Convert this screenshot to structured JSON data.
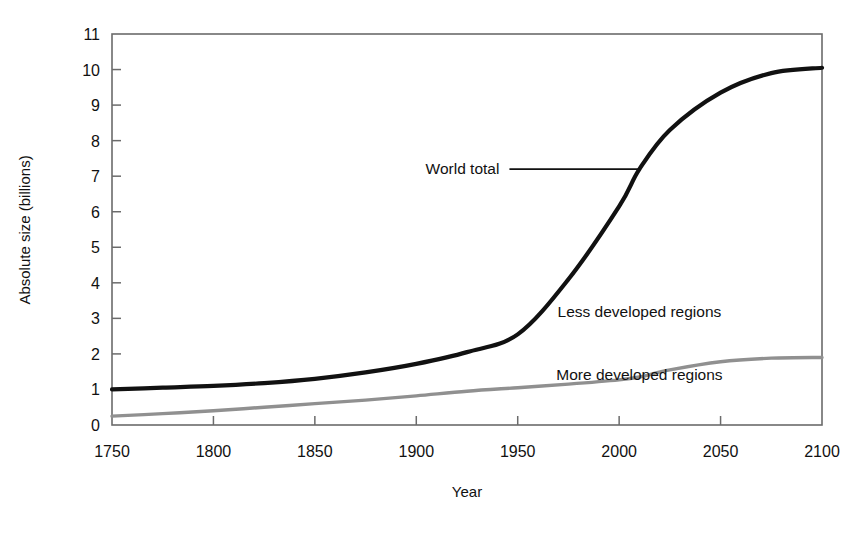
{
  "chart_data": {
    "type": "line",
    "title": "",
    "xlabel": "Year",
    "ylabel": "Absolute size (billions)",
    "xlim": [
      1750,
      2100
    ],
    "ylim": [
      0,
      11
    ],
    "xticks": [
      "1750",
      "1800",
      "1850",
      "1900",
      "1950",
      "2000",
      "2050",
      "2100"
    ],
    "yticks": [
      "0",
      "1",
      "2",
      "3",
      "4",
      "5",
      "6",
      "7",
      "8",
      "9",
      "10",
      "11"
    ],
    "grid": false,
    "legend_position": "inline-annotations",
    "x": [
      1750,
      1775,
      1800,
      1825,
      1850,
      1875,
      1900,
      1925,
      1950,
      1975,
      2000,
      2010,
      2025,
      2050,
      2075,
      2100
    ],
    "series": [
      {
        "name": "World total",
        "color": "#111111",
        "values": [
          1.0,
          1.05,
          1.1,
          1.18,
          1.3,
          1.48,
          1.72,
          2.05,
          2.55,
          4.1,
          6.15,
          7.2,
          8.3,
          9.35,
          9.9,
          10.05
        ]
      },
      {
        "name": "More developed regions",
        "color": "#909090",
        "values": [
          0.25,
          0.32,
          0.4,
          0.5,
          0.6,
          0.7,
          0.82,
          0.95,
          1.05,
          1.15,
          1.27,
          1.35,
          1.55,
          1.78,
          1.88,
          1.9
        ]
      }
    ],
    "annotations": [
      {
        "text": "World total",
        "target_series": "World total",
        "target_x": 2010,
        "target_y": 7.2,
        "leader": true
      },
      {
        "text": "Less developed regions",
        "description": "band between World total and More developed regions",
        "at_x": 2010,
        "at_y": 3.05,
        "leader": false
      },
      {
        "text": "More developed regions",
        "description": "band below More developed regions curve",
        "at_x": 2010,
        "at_y": 1.28,
        "leader": false
      }
    ]
  },
  "axes": {
    "y_title": "Absolute size (billions)",
    "x_title": "Year"
  },
  "colors": {
    "world_total": "#111111",
    "more_developed": "#909090",
    "frame": "#6b6b6b",
    "background": "#ffffff"
  }
}
